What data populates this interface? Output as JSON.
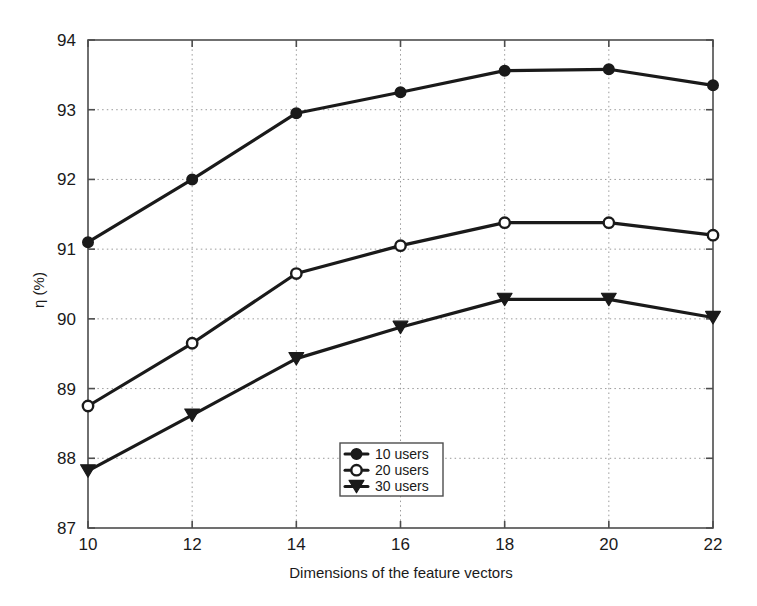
{
  "chart_data": {
    "type": "line",
    "title": "",
    "xlabel": "Dimensions of the feature vectors",
    "ylabel": "η (%)",
    "x": [
      10,
      12,
      14,
      16,
      18,
      20,
      22
    ],
    "xticks": [
      "10",
      "12",
      "14",
      "16",
      "18",
      "20",
      "22"
    ],
    "yticks": [
      "87",
      "88",
      "89",
      "90",
      "91",
      "92",
      "93",
      "94"
    ],
    "xlim": [
      10,
      22
    ],
    "ylim": [
      87,
      94
    ],
    "grid": "dotted",
    "legend_position": "lower-center",
    "series": [
      {
        "name": "10 users",
        "marker": "filled-circle",
        "color": "#1a1a1a",
        "values": [
          91.1,
          92.0,
          92.95,
          93.25,
          93.56,
          93.58,
          93.35
        ]
      },
      {
        "name": "20 users",
        "marker": "open-circle",
        "color": "#1a1a1a",
        "values": [
          88.75,
          89.65,
          90.65,
          91.05,
          91.38,
          91.38,
          91.2
        ]
      },
      {
        "name": "30 users",
        "marker": "filled-triangle-down",
        "color": "#1a1a1a",
        "values": [
          87.82,
          88.62,
          89.43,
          89.88,
          90.28,
          90.28,
          90.02
        ]
      }
    ]
  },
  "legend": {
    "items": [
      {
        "label": "10 users"
      },
      {
        "label": "20 users"
      },
      {
        "label": "30 users"
      }
    ]
  },
  "axes": {
    "x_title": "Dimensions of the feature vectors",
    "y_title": "η (%)"
  },
  "colors": {
    "line": "#1a1a1a",
    "grid": "#9a9a9a",
    "axis": "#4d4d4d",
    "background": "#ffffff"
  }
}
